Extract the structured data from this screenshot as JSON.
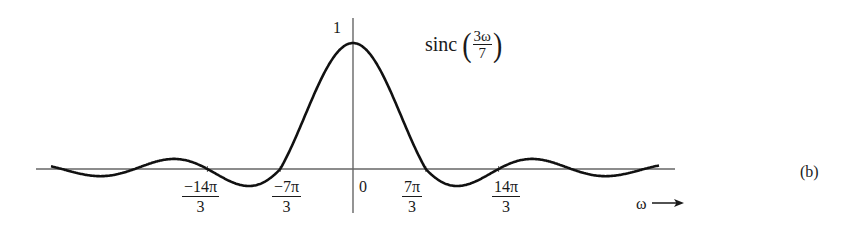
{
  "chart_data": {
    "type": "line",
    "title_parts": {
      "func": "sinc",
      "numerator": "3ω",
      "denominator": "7"
    },
    "function": "sinc(3ω/7) = sin(3ω/7)/(3ω/7)",
    "xlabel": "ω →",
    "ylabel": "",
    "y_tick_labels": [
      {
        "value": 1,
        "label": "1"
      }
    ],
    "x_tick_labels": [
      {
        "value_in_units_of_7pi_over_3": -2,
        "numerator": "−14π",
        "denominator": "3"
      },
      {
        "value_in_units_of_7pi_over_3": -1,
        "numerator": "−7π",
        "denominator": "3"
      },
      {
        "value_in_units_of_7pi_over_3": 0,
        "label": "0"
      },
      {
        "value_in_units_of_7pi_over_3": 1,
        "numerator": "7π",
        "denominator": "3"
      },
      {
        "value_in_units_of_7pi_over_3": 2,
        "numerator": "14π",
        "denominator": "3"
      }
    ],
    "zero_crossings": [
      "−28π/3",
      "−7π",
      "−14π/3",
      "−7π/3",
      "7π/3",
      "14π/3",
      "7π",
      "28π/3"
    ],
    "peak": {
      "x": 0,
      "y": 1
    },
    "x_range_units_of_7pi_over_3": [
      -4.15,
      4.2
    ],
    "grid": false,
    "legend": null
  },
  "figure_label": "(b)",
  "layout": {
    "origin_x": 353,
    "axis_y": 169,
    "px_per_zero_spacing": 72.8,
    "px_per_unit_y": 126,
    "side_lobe_gain": 0.62,
    "h_axis": [
      36,
      675
    ],
    "v_axis": [
      18,
      213
    ],
    "curve_x_range": [
      51,
      659
    ]
  },
  "colors": {
    "curve": "#111111",
    "axis": "#555555",
    "text": "#1a1a1a"
  }
}
